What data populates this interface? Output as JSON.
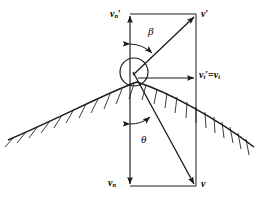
{
  "figure": {
    "stroke_color": "#1a1a1a",
    "background_color": "#ffffff"
  },
  "labels": {
    "normal_out": {
      "base": "v",
      "sub": "n",
      "prime": "′",
      "full": "vₙ′"
    },
    "velocity_out": {
      "base": "v",
      "sub": "",
      "prime": "′",
      "full": "v′"
    },
    "tangential": {
      "base": "v",
      "sub": "t",
      "prime": "′",
      "equals": "=",
      "base2": "v",
      "sub2": "t",
      "full": "vₜ′ = vₜ"
    },
    "normal_in": {
      "base": "v",
      "sub": "n",
      "prime": "",
      "full": "vₙ"
    },
    "velocity_in": {
      "base": "v",
      "sub": "",
      "prime": "",
      "full": "v"
    }
  },
  "angles": {
    "beta": {
      "symbol": "β",
      "description": "angle between outgoing normal axis and rebound velocity v′"
    },
    "theta": {
      "symbol": "θ",
      "description": "angle between incoming normal axis and incident velocity v"
    }
  },
  "elements": {
    "ball": "circle at contact point",
    "surface": "hatched curved boundary",
    "rectangle": "velocity component construction rectangle"
  }
}
